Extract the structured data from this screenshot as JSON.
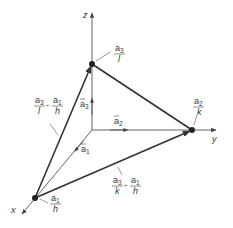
{
  "figure": {
    "type": "reciprocal lattice plane intercept diagram",
    "axes": {
      "x": {
        "label": "x"
      },
      "y": {
        "label": "y"
      },
      "z": {
        "label": "z"
      }
    },
    "basis_vectors": {
      "a1": {
        "base": "a",
        "sub": "1"
      },
      "a2": {
        "base": "a",
        "sub": "2"
      },
      "a3": {
        "base": "a",
        "sub": "3"
      }
    },
    "intercepts": {
      "x": {
        "num_base": "a",
        "num_sub": "1",
        "den": "h"
      },
      "y": {
        "num_base": "a",
        "num_sub": "2",
        "den": "k"
      },
      "z": {
        "num_base": "a",
        "num_sub": "3",
        "den": "l"
      }
    },
    "edge_vectors": {
      "xz": {
        "t1_base": "a",
        "t1_sub": "3",
        "t1_den": "l",
        "op": "-",
        "t2_base": "a",
        "t2_sub": "1",
        "t2_den": "h"
      },
      "xy": {
        "t1_base": "a",
        "t1_sub": "3",
        "t1_den": "k",
        "op": "-",
        "t2_base": "a",
        "t2_sub": "1",
        "t2_den": "h"
      }
    },
    "colors": {
      "line": "#333333",
      "axis": "#555555",
      "text": "#3a3a3a",
      "background": "#ffffff"
    }
  }
}
